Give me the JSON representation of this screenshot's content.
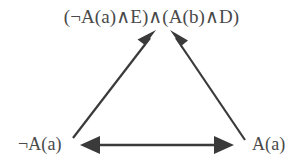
{
  "diagram": {
    "type": "directed-graph",
    "background_color": "#ffffff",
    "stroke_color": "#3a3a3a",
    "text_color": "#4a4a4a",
    "nodes": [
      {
        "id": "apex",
        "label": "(¬A(a)∧E)∧(A(b)∧D)",
        "position": "top-center"
      },
      {
        "id": "left",
        "label": "¬A(a)",
        "position": "bottom-left"
      },
      {
        "id": "right",
        "label": "A(a)",
        "position": "bottom-right"
      }
    ],
    "edges": [
      {
        "id": "edge-left-to-apex",
        "from": "left",
        "to": "apex",
        "direction": "single",
        "arrowheads": "end"
      },
      {
        "id": "edge-right-to-apex",
        "from": "right",
        "to": "apex",
        "direction": "single",
        "arrowheads": "end"
      },
      {
        "id": "edge-left-right",
        "from": "left",
        "to": "right",
        "direction": "bidirectional",
        "arrowheads": "both"
      }
    ]
  }
}
